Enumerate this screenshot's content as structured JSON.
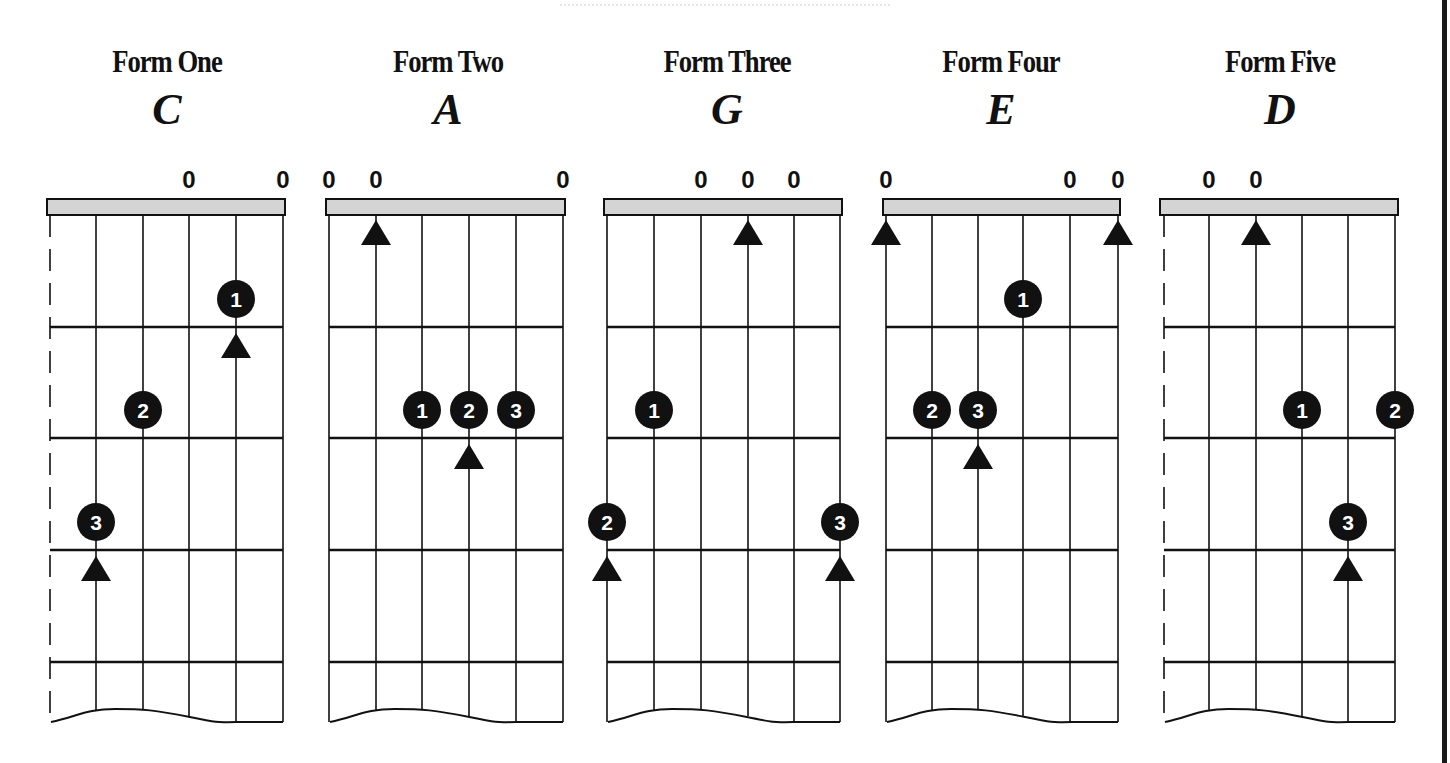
{
  "colors": {
    "ink": "#111111",
    "nut_fill": "#d4d4d4",
    "dot_fill": "#111111",
    "dot_text": "#ffffff",
    "background": "#ffffff"
  },
  "layout": {
    "nut_top": 199,
    "nut_bottom": 215,
    "fret_lines_y": [
      327,
      438,
      550,
      662
    ],
    "open_label_y": 188,
    "wave_bottom_y": 722,
    "wave_top_y": 709
  },
  "forms": [
    {
      "title": "Form One",
      "key": "C",
      "title_center_x": 167,
      "nut_x": [
        47,
        285
      ],
      "strings_x": [
        50,
        96,
        143,
        189,
        236,
        283
      ],
      "muted_strings": [
        0
      ],
      "open_strings": [
        3,
        5
      ],
      "open_label": "0",
      "fingers": [
        {
          "num": "1",
          "string": 4,
          "fret": 1
        },
        {
          "num": "2",
          "string": 2,
          "fret": 2
        },
        {
          "num": "3",
          "string": 1,
          "fret": 3
        }
      ],
      "root_markers": [
        {
          "string": 4,
          "fret": 1
        },
        {
          "string": 1,
          "fret": 3
        }
      ]
    },
    {
      "title": "Form Two",
      "key": "A",
      "title_center_x": 448,
      "nut_x": [
        326,
        565
      ],
      "strings_x": [
        329,
        376,
        422,
        469,
        516,
        563
      ],
      "muted_strings": [],
      "open_strings": [
        0,
        1,
        5
      ],
      "open_label": "0",
      "fingers": [
        {
          "num": "1",
          "string": 2,
          "fret": 2
        },
        {
          "num": "2",
          "string": 3,
          "fret": 2
        },
        {
          "num": "3",
          "string": 4,
          "fret": 2
        }
      ],
      "root_markers": [
        {
          "string": 1,
          "fret": 0
        },
        {
          "string": 3,
          "fret": 2
        }
      ]
    },
    {
      "title": "Form Three",
      "key": "G",
      "title_center_x": 727,
      "nut_x": [
        604,
        842
      ],
      "strings_x": [
        607,
        654,
        701,
        748,
        794,
        840
      ],
      "muted_strings": [],
      "open_strings": [
        2,
        3,
        4
      ],
      "open_label": "0",
      "fingers": [
        {
          "num": "1",
          "string": 1,
          "fret": 2
        },
        {
          "num": "2",
          "string": 0,
          "fret": 3
        },
        {
          "num": "3",
          "string": 5,
          "fret": 3
        }
      ],
      "root_markers": [
        {
          "string": 3,
          "fret": 0
        },
        {
          "string": 0,
          "fret": 3
        },
        {
          "string": 5,
          "fret": 3
        }
      ]
    },
    {
      "title": "Form Four",
      "key": "E",
      "title_center_x": 1001,
      "nut_x": [
        883,
        1120
      ],
      "strings_x": [
        886,
        932,
        978,
        1023,
        1070,
        1118
      ],
      "muted_strings": [],
      "open_strings": [
        0,
        4,
        5
      ],
      "open_label": "0",
      "fingers": [
        {
          "num": "1",
          "string": 3,
          "fret": 1
        },
        {
          "num": "2",
          "string": 1,
          "fret": 2
        },
        {
          "num": "3",
          "string": 2,
          "fret": 2
        }
      ],
      "root_markers": [
        {
          "string": 0,
          "fret": 0
        },
        {
          "string": 5,
          "fret": 0
        },
        {
          "string": 2,
          "fret": 2
        }
      ]
    },
    {
      "title": "Form Five",
      "key": "D",
      "title_center_x": 1280,
      "nut_x": [
        1160,
        1398
      ],
      "strings_x": [
        1164,
        1209,
        1256,
        1302,
        1348,
        1395
      ],
      "muted_strings": [
        0
      ],
      "open_strings": [
        1,
        2
      ],
      "open_label": "0",
      "fingers": [
        {
          "num": "1",
          "string": 3,
          "fret": 2
        },
        {
          "num": "2",
          "string": 5,
          "fret": 2
        },
        {
          "num": "3",
          "string": 4,
          "fret": 3
        }
      ],
      "root_markers": [
        {
          "string": 2,
          "fret": 0
        },
        {
          "string": 4,
          "fret": 3
        }
      ]
    }
  ]
}
